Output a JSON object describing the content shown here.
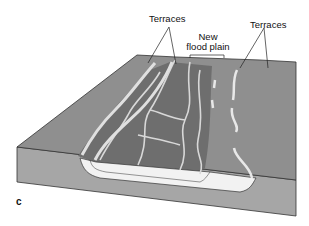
{
  "diagram": {
    "panel_letter": "c",
    "labels": {
      "terraces_left": "Terraces",
      "terraces_right": "Terraces",
      "new_flood_plain_line1": "New",
      "new_flood_plain_line2": "flood plain"
    },
    "colors": {
      "surface": "#8f8f8f",
      "front_face": "#a6a6a6",
      "flood_plain": "#6e6e6e",
      "channel": "#d8d8d8",
      "sediment": "#f2f2f2",
      "outline": "#333333"
    }
  }
}
